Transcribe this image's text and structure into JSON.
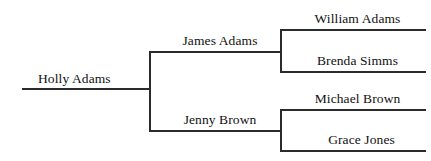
{
  "diagram": {
    "type": "pedigree-chart",
    "orientation": "left-to-right",
    "generations": 3,
    "line_color": "#2b2b2b",
    "text_color": "#111111",
    "background_color": "#ffffff"
  },
  "people": {
    "root": {
      "name": "Holly Adams",
      "generation": 1,
      "relation": "self"
    },
    "father": {
      "name": "James Adams",
      "generation": 2,
      "relation": "father"
    },
    "mother": {
      "name": "Jenny Brown",
      "generation": 2,
      "relation": "mother"
    },
    "paternal_grandfather": {
      "name": "William Adams",
      "generation": 3,
      "relation": "paternal-grandfather"
    },
    "paternal_grandmother": {
      "name": "Brenda Simms",
      "generation": 3,
      "relation": "paternal-grandmother"
    },
    "maternal_grandfather": {
      "name": "Michael Brown",
      "generation": 3,
      "relation": "maternal-grandfather"
    },
    "maternal_grandmother": {
      "name": "Grace Jones",
      "generation": 3,
      "relation": "maternal-grandmother"
    }
  }
}
